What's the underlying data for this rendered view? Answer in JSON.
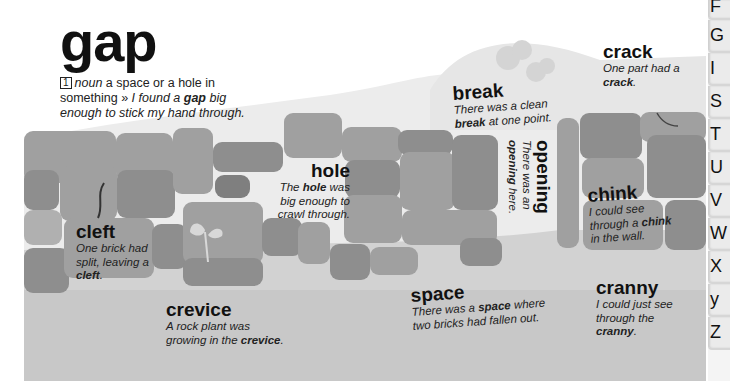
{
  "entry": {
    "headword": "gap",
    "sense_number": "1",
    "part_of_speech": "noun",
    "definition": "a space or a hole in something",
    "example_separator": "»",
    "example_pre": "I found a",
    "example_bold": "gap",
    "example_post": "big enough to stick my hand through."
  },
  "synonyms": [
    {
      "word": "crack",
      "pre": "One part had a",
      "bold": "crack",
      "post": "."
    },
    {
      "word": "break",
      "pre": "There was a clean",
      "bold": "break",
      "post": "at one point."
    },
    {
      "word": "opening",
      "pre": "There was an",
      "bold": "opening",
      "post": "here."
    },
    {
      "word": "hole",
      "pre": "The",
      "bold": "hole",
      "post": "was big enough to crawl through."
    },
    {
      "word": "chink",
      "pre": "I could see through a",
      "bold": "chink",
      "post": "in the wall."
    },
    {
      "word": "cleft",
      "pre": "One brick had split, leaving a",
      "bold": "cleft",
      "post": "."
    },
    {
      "word": "crevice",
      "pre": "A rock plant was growing in the",
      "bold": "crevice",
      "post": "."
    },
    {
      "word": "space",
      "pre": "There was a",
      "bold": "space",
      "post": "where two bricks had fallen out."
    },
    {
      "word": "cranny",
      "pre": "I could just see through the",
      "bold": "cranny",
      "post": "."
    }
  ],
  "alphabet_tabs": [
    "F",
    "G",
    "I",
    "S",
    "T",
    "U",
    "V",
    "W",
    "X",
    "y",
    "Z"
  ],
  "colors": {
    "background": "#ffffff",
    "hill": "#e8e8e8",
    "ground": "#c8c8c8",
    "brick_light": "#b0b0b0",
    "brick_mid": "#a0a0a0",
    "brick_dark": "#8e8e8e",
    "text": "#111111"
  }
}
